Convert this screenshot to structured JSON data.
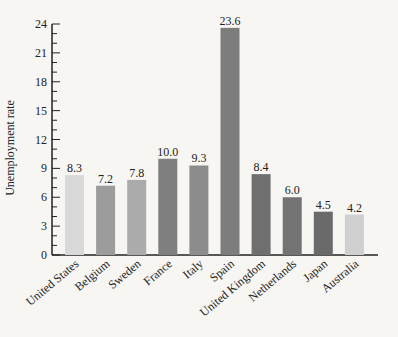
{
  "chart_data": {
    "type": "bar",
    "title": "",
    "xlabel": "",
    "ylabel": "Unemployment rate",
    "ylim": [
      0,
      24
    ],
    "yticks": [
      0,
      3,
      6,
      9,
      12,
      15,
      18,
      21,
      24
    ],
    "grid": false,
    "legend": null,
    "categories": [
      "United States",
      "Belgium",
      "Sweden",
      "France",
      "Italy",
      "Spain",
      "United Kingdom",
      "Netherlands",
      "Japan",
      "Australia"
    ],
    "values": [
      8.3,
      7.2,
      7.8,
      10.0,
      9.3,
      23.6,
      8.4,
      6.0,
      4.5,
      4.2
    ],
    "value_labels": [
      "8.3",
      "7.2",
      "7.8",
      "10.0",
      "9.3",
      "23.6",
      "8.4",
      "6.0",
      "4.5",
      "4.2"
    ],
    "bar_colors": [
      "#d9d9d9",
      "#9c9c9c",
      "#ababab",
      "#7f7f7f",
      "#8c8c8c",
      "#7d7d7d",
      "#6f6f6f",
      "#737373",
      "#6a6a6a",
      "#d0d0d0"
    ]
  }
}
